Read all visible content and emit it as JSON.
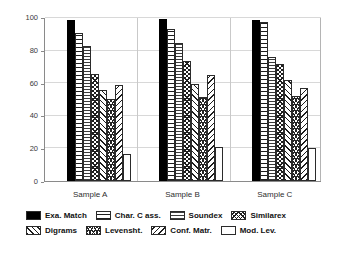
{
  "chart_data": {
    "type": "bar",
    "title": "",
    "subtitle": "",
    "xlabel": "",
    "ylabel": "",
    "ylim": [
      0,
      100
    ],
    "yticks": [
      0,
      20,
      40,
      60,
      80,
      100
    ],
    "grid": true,
    "legend_position": "bottom",
    "categories": [
      "Sample A",
      "Sample B",
      "Sample C"
    ],
    "series": [
      {
        "name": "Exa. Match",
        "pattern": "solid-black",
        "values": [
          99,
          99.5,
          99
        ]
      },
      {
        "name": "Char. C ass.",
        "pattern": "horizontal-lines",
        "values": [
          91,
          93,
          97.5
        ]
      },
      {
        "name": "Soundex",
        "pattern": "dense-horizontal",
        "values": [
          83,
          84.5,
          76
        ]
      },
      {
        "name": "Similarex",
        "pattern": "cross-hatch",
        "values": [
          65.5,
          73.5,
          71.5
        ]
      },
      {
        "name": "Digrams",
        "pattern": "diagonal-up",
        "values": [
          56,
          59.5,
          62
        ]
      },
      {
        "name": "Levensht.",
        "pattern": "dense-cross-hatch",
        "values": [
          50.5,
          51.5,
          52
        ]
      },
      {
        "name": "Conf. Matr.",
        "pattern": "diagonal-down",
        "values": [
          59,
          65,
          57
        ]
      },
      {
        "name": "Mod. Lev.",
        "pattern": "empty-white",
        "values": [
          16.5,
          21,
          20
        ]
      }
    ]
  },
  "legend": {
    "rows": [
      [
        "Exa. Match",
        "Char. C ass.",
        "Soundex",
        "Similarex"
      ],
      [
        "Digrams",
        "Levensht.",
        "Conf. Matr.",
        "Mod. Lev."
      ]
    ]
  },
  "colors": {
    "axis": "#8a8a8a",
    "grid": "#d8d8d8",
    "bar_outline": "#2b2b2b",
    "background": "#ffffff",
    "text": "#111111"
  }
}
